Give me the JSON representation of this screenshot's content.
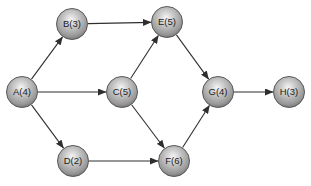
{
  "diagram": {
    "type": "directed-graph",
    "background_color": "#ffffff",
    "node_style": {
      "radius": 15.5,
      "gradient_highlight": "#f6f6f6",
      "gradient_mid": "#c3c3c3",
      "gradient_dark": "#989898",
      "gradient_rim": "#6e6e6e",
      "stroke_color": "#5a5a5a",
      "label_color": "#1c1c1c"
    },
    "edge_style": {
      "color": "#2e2e2e",
      "width": 1.1,
      "arrowhead": "filled-triangle"
    },
    "nodes": [
      {
        "id": "A",
        "label": "A(4)",
        "x": 22,
        "y": 92
      },
      {
        "id": "B",
        "label": "B(3)",
        "x": 72,
        "y": 24
      },
      {
        "id": "C",
        "label": "C(5)",
        "x": 122,
        "y": 92
      },
      {
        "id": "D",
        "label": "D(2)",
        "x": 73,
        "y": 161
      },
      {
        "id": "E",
        "label": "E(5)",
        "x": 167,
        "y": 22
      },
      {
        "id": "F",
        "label": "F(6)",
        "x": 174,
        "y": 161
      },
      {
        "id": "G",
        "label": "G(4)",
        "x": 218,
        "y": 92
      },
      {
        "id": "H",
        "label": "H(3)",
        "x": 289,
        "y": 92
      }
    ],
    "edges": [
      {
        "from": "A",
        "to": "B"
      },
      {
        "from": "A",
        "to": "C"
      },
      {
        "from": "A",
        "to": "D"
      },
      {
        "from": "B",
        "to": "E"
      },
      {
        "from": "C",
        "to": "E"
      },
      {
        "from": "C",
        "to": "F"
      },
      {
        "from": "D",
        "to": "F"
      },
      {
        "from": "E",
        "to": "G"
      },
      {
        "from": "F",
        "to": "G"
      },
      {
        "from": "G",
        "to": "H"
      }
    ]
  }
}
